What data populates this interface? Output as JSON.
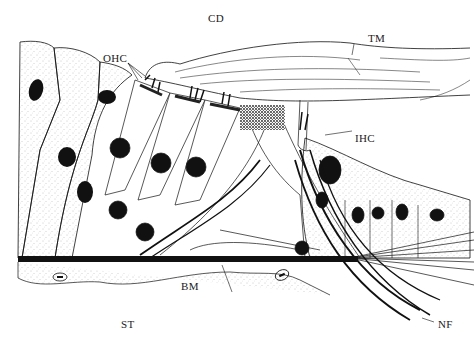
{
  "figure": {
    "labels": {
      "cd": "CD",
      "tm": "TM",
      "ohc": "OHC",
      "ihc": "IHC",
      "bm": "BM",
      "st": "ST",
      "nf": "NF"
    },
    "colors": {
      "ink": "#111111",
      "stipple": "#9a9a9a",
      "background": "#ffffff"
    }
  }
}
